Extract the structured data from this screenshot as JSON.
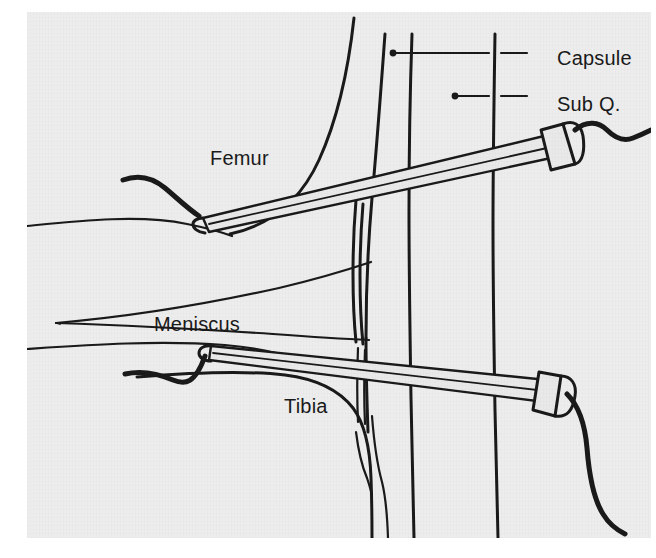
{
  "figure": {
    "background_color": "#ededed",
    "page_color": "#ffffff",
    "ink_color": "#1a1a1a",
    "panel": {
      "x": 27,
      "y": 12,
      "width": 624,
      "height": 526
    }
  },
  "labels": {
    "femur": "Femur",
    "meniscus": "Meniscus",
    "tibia": "Tibia",
    "capsule": "Capsule",
    "subq": "Sub Q."
  },
  "leaders": [
    {
      "name": "capsule-leader",
      "label": "Capsule",
      "dot_x": 393,
      "dot_y": 53,
      "line_to_x": 525,
      "line_to_y": 53
    },
    {
      "name": "subq-leader",
      "label": "Sub Q.",
      "dot_x": 455,
      "dot_y": 96,
      "line_to_x": 525,
      "line_to_y": 96
    }
  ],
  "structures": [
    {
      "name": "femur-condyle-outline",
      "label": "Femur"
    },
    {
      "name": "femur-inferior-border",
      "label": "Femur"
    },
    {
      "name": "meniscus-wedge",
      "label": "Meniscus"
    },
    {
      "name": "tibia-plateau-outline",
      "label": "Tibia"
    },
    {
      "name": "capsule-vertical-line",
      "label": "Capsule"
    },
    {
      "name": "subq-vertical-line",
      "label": "Sub Q."
    },
    {
      "name": "synovial-fold-lines",
      "label": "Capsule"
    }
  ],
  "instruments": [
    {
      "name": "superior-instrument",
      "description": "Arthroscope entering superior portal, tip at femoral condyle, hub upper right with cord",
      "tip_x": 200,
      "tip_y": 224,
      "hub_x": 553,
      "hub_y": 152
    },
    {
      "name": "inferior-instrument",
      "description": "Working instrument entering inferior portal, tip at tibial plateau, hub lower right with cord",
      "tip_x": 208,
      "tip_y": 352,
      "hub_x": 556,
      "hub_y": 400
    }
  ]
}
